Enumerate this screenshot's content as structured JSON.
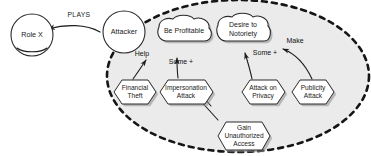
{
  "diagram": {
    "type": "i-star-goal-model",
    "colors": {
      "boundary_fill": "#ebebeb",
      "canvas": "#ffffff",
      "stroke": "#1d1d1d",
      "node_fill": "#ffffff",
      "shadow": "#8c8c8c"
    },
    "boundary": {
      "name": "actor-boundary",
      "style": "dashed-ellipse"
    }
  },
  "actors": [
    {
      "id": "role-x",
      "label": "Role X",
      "shape": "circle"
    },
    {
      "id": "attacker",
      "label": "Attacker",
      "shape": "circle"
    }
  ],
  "softgoals": [
    {
      "id": "be-profitable",
      "label": "Be Profitable",
      "line1": "Be Profitable",
      "line2": ""
    },
    {
      "id": "desire-to-notoriety",
      "label": "Desire to Notoriety",
      "line1": "Desire to",
      "line2": "Notoriety"
    }
  ],
  "tasks": [
    {
      "id": "financial-theft",
      "label": "Financial Theft",
      "line1": "Financial",
      "line2": "Theft",
      "line3": ""
    },
    {
      "id": "impersonation-attack",
      "label": "Impersonation Attack",
      "line1": "Impersonation",
      "line2": "Attack",
      "line3": ""
    },
    {
      "id": "attack-on-privacy",
      "label": "Attack on Privacy",
      "line1": "Attack on",
      "line2": "Privacy",
      "line3": ""
    },
    {
      "id": "publicity-attack",
      "label": "Publicity Attack",
      "line1": "Publicity",
      "line2": "Attack",
      "line3": ""
    },
    {
      "id": "gain-unauthorized-access",
      "label": "Gain Unauthorized Access",
      "line1": "Gain",
      "line2": "Unauthorized",
      "line3": "Access"
    }
  ],
  "links": [
    {
      "id": "plays",
      "label": "PLAYS",
      "from": "attacker",
      "to": "role-x",
      "kind": "association"
    },
    {
      "id": "help",
      "label": "Help",
      "from": "financial-theft",
      "to": "be-profitable",
      "kind": "contribution"
    },
    {
      "id": "some-plus-1",
      "label": "Some +",
      "from": "impersonation-attack",
      "to": "be-profitable",
      "kind": "contribution"
    },
    {
      "id": "some-plus-2",
      "label": "Some +",
      "from": "attack-on-privacy",
      "to": "desire-to-notoriety",
      "kind": "contribution"
    },
    {
      "id": "make",
      "label": "Make",
      "from": "publicity-attack",
      "to": "desire-to-notoriety",
      "kind": "contribution"
    },
    {
      "id": "means-ends",
      "label": "",
      "from": "gain-unauthorized-access",
      "to": "impersonation-attack",
      "kind": "means-ends"
    }
  ]
}
